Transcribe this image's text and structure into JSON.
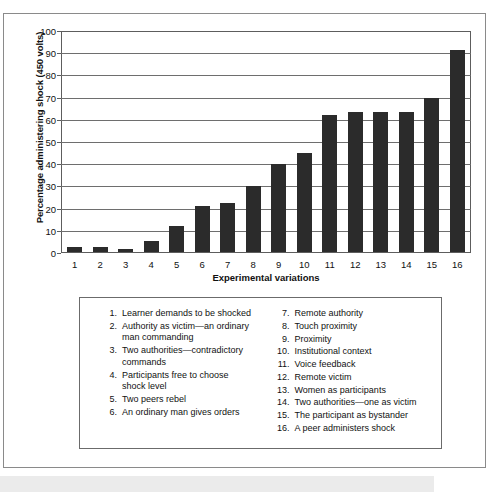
{
  "figure": {
    "y_axis_title": "Percentage administering shock (450 volts)",
    "x_axis_title": "Experimental variations"
  },
  "chart_data": {
    "type": "bar",
    "title": "",
    "xlabel": "Experimental variations",
    "ylabel": "Percentage administering shock (450 volts)",
    "ylim": [
      0,
      100
    ],
    "ytick_labels": [
      "0",
      "10",
      "20",
      "30",
      "40",
      "50",
      "60",
      "70",
      "80",
      "90",
      "100"
    ],
    "yticks": [
      0,
      10,
      20,
      30,
      40,
      50,
      60,
      70,
      80,
      90,
      100
    ],
    "grid": true,
    "legend_position": "below-chart",
    "categories": [
      "1",
      "2",
      "3",
      "4",
      "5",
      "6",
      "7",
      "8",
      "9",
      "10",
      "11",
      "12",
      "13",
      "14",
      "15",
      "16"
    ],
    "values": [
      2.5,
      2.5,
      1.5,
      5,
      12,
      21,
      22.5,
      30,
      40,
      45,
      62.5,
      63.5,
      63.5,
      63.5,
      70,
      92
    ],
    "bar_color": "#2b2b2b",
    "grid_color": "#6e6e6e",
    "background_color": "#ffffff"
  },
  "legend": {
    "left_column": [
      {
        "num": "1.",
        "text": "Learner demands to be shocked"
      },
      {
        "num": "2.",
        "text": "Authority as victim—an ordinary man commanding"
      },
      {
        "num": "3.",
        "text": "Two authorities—contradictory commands"
      },
      {
        "num": "4.",
        "text": "Participants free to choose shock level"
      },
      {
        "num": "5.",
        "text": "Two peers rebel"
      },
      {
        "num": "6.",
        "text": "An ordinary man gives orders"
      }
    ],
    "right_column": [
      {
        "num": "7.",
        "text": "Remote authority"
      },
      {
        "num": "8.",
        "text": "Touch proximity"
      },
      {
        "num": "9.",
        "text": "Proximity"
      },
      {
        "num": "10.",
        "text": "Institutional context"
      },
      {
        "num": "11.",
        "text": "Voice feedback"
      },
      {
        "num": "12.",
        "text": "Remote victim"
      },
      {
        "num": "13.",
        "text": "Women as participants"
      },
      {
        "num": "14.",
        "text": "Two authorities—one as victim"
      },
      {
        "num": "15.",
        "text": "The participant as bystander"
      },
      {
        "num": "16.",
        "text": "A peer administers shock"
      }
    ]
  }
}
